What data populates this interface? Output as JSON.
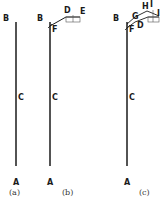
{
  "colors": {
    "line": "#1a1a1a",
    "background": "#ffffff"
  },
  "panels": [
    {
      "caption": "(a)",
      "labels": {
        "B": "B",
        "C": "C",
        "A": "A"
      }
    },
    {
      "caption": "(b)",
      "labels": {
        "B": "B",
        "C": "C",
        "A": "A",
        "D": "D",
        "E": "E",
        "F": "F"
      }
    },
    {
      "caption": "(c)",
      "labels": {
        "B": "B",
        "C": "C",
        "A": "A",
        "D": "D",
        "F": "F",
        "G": "G",
        "H": "H",
        "I1": "I",
        "I2": "I"
      }
    }
  ]
}
